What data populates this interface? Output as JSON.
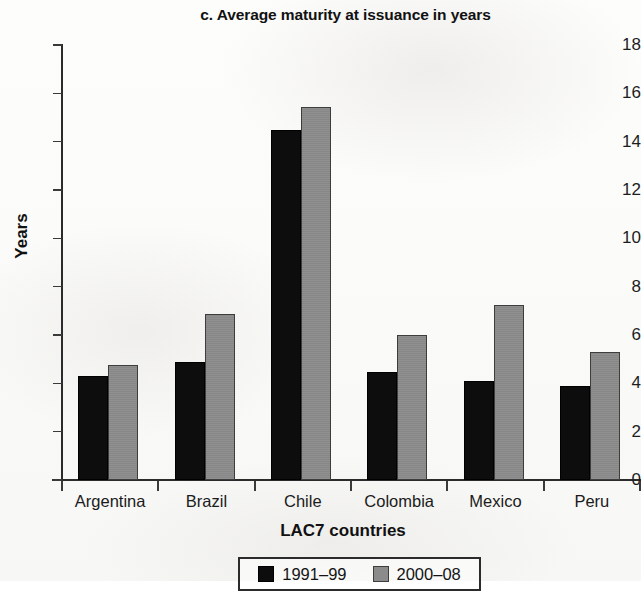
{
  "chart_data": {
    "type": "bar",
    "title": "c. Average maturity at issuance in years",
    "xlabel": "LAC7 countries",
    "ylabel": "Years",
    "categories": [
      "Argentina",
      "Brazil",
      "Chile",
      "Colombia",
      "Mexico",
      "Peru"
    ],
    "series": [
      {
        "name": "1991–99",
        "color": "#0d0d0d",
        "values": [
          4.3,
          4.9,
          14.5,
          4.45,
          4.1,
          3.9
        ]
      },
      {
        "name": "2000–08",
        "color": "#8b8b8b",
        "values": [
          4.75,
          6.85,
          15.45,
          6.0,
          7.25,
          5.3
        ]
      }
    ],
    "ylim": [
      0,
      18
    ],
    "yticks": [
      0,
      2,
      4,
      6,
      8,
      10,
      12,
      14,
      16,
      18
    ],
    "ytick_labels": [
      "0",
      "2",
      "4",
      "6",
      "8",
      "10",
      "12",
      "14",
      "16",
      "18"
    ],
    "grid": false,
    "legend_position": "bottom-center"
  }
}
